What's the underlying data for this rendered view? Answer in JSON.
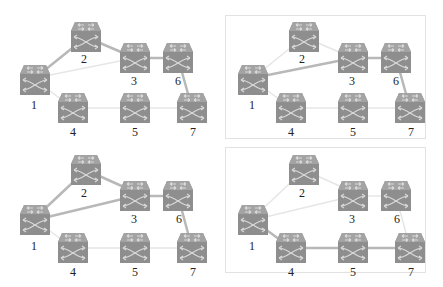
{
  "figure": {
    "colors": {
      "switch_body": "#8e8e8e",
      "switch_top": "#a6a6a6",
      "switch_arrow": "#d9d9d9",
      "link_active": "#b5b5b5",
      "link_inactive": "#e6e6e6",
      "panel_border": "#e2e2e2",
      "label": "#222222"
    },
    "node_labels": [
      "1",
      "2",
      "3",
      "4",
      "5",
      "6",
      "7"
    ],
    "panels": [
      {
        "id": "top-left",
        "boxed": false,
        "active_links": [
          [
            "1",
            "2"
          ],
          [
            "2",
            "3"
          ],
          [
            "3",
            "6"
          ],
          [
            "6",
            "7"
          ]
        ],
        "inactive_links": [
          [
            "1",
            "3"
          ],
          [
            "1",
            "4"
          ],
          [
            "4",
            "5"
          ],
          [
            "5",
            "7"
          ]
        ]
      },
      {
        "id": "top-right",
        "boxed": true,
        "active_links": [
          [
            "1",
            "3"
          ],
          [
            "3",
            "6"
          ],
          [
            "6",
            "7"
          ]
        ],
        "inactive_links": [
          [
            "1",
            "2"
          ],
          [
            "2",
            "3"
          ],
          [
            "1",
            "4"
          ],
          [
            "4",
            "5"
          ],
          [
            "5",
            "7"
          ]
        ]
      },
      {
        "id": "bottom-left",
        "boxed": false,
        "active_links": [
          [
            "1",
            "2"
          ],
          [
            "2",
            "3"
          ],
          [
            "1",
            "3"
          ],
          [
            "3",
            "6"
          ],
          [
            "6",
            "7"
          ]
        ],
        "inactive_links": [
          [
            "1",
            "4"
          ],
          [
            "4",
            "5"
          ],
          [
            "5",
            "7"
          ]
        ]
      },
      {
        "id": "bottom-right",
        "boxed": true,
        "active_links": [
          [
            "1",
            "4"
          ],
          [
            "4",
            "5"
          ],
          [
            "5",
            "7"
          ]
        ],
        "inactive_links": [
          [
            "1",
            "2"
          ],
          [
            "2",
            "3"
          ],
          [
            "1",
            "3"
          ],
          [
            "3",
            "6"
          ],
          [
            "6",
            "7"
          ]
        ]
      }
    ]
  },
  "caption": ""
}
